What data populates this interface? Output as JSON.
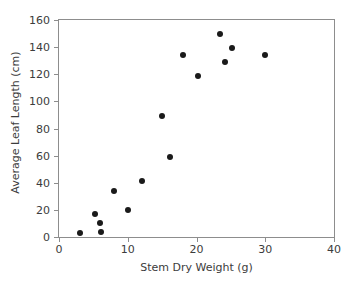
{
  "chart_data": {
    "type": "scatter",
    "title": "",
    "xlabel": "Stem Dry Weight (g)",
    "ylabel": "Average Leaf Length (cm)",
    "xlim": [
      0,
      40
    ],
    "ylim": [
      0,
      160
    ],
    "xticks": [
      0,
      10,
      20,
      30,
      40
    ],
    "yticks": [
      0,
      20,
      40,
      60,
      80,
      100,
      120,
      140,
      160
    ],
    "xtick_labels": [
      "0",
      "10",
      "20",
      "30",
      "40"
    ],
    "ytick_labels": [
      "0",
      "20",
      "40",
      "60",
      "80",
      "100",
      "120",
      "140",
      "160"
    ],
    "grid": false,
    "legend": null,
    "marker": "filled-circle",
    "marker_color": "#1a1a1a",
    "axis_color": "#8d8d8d",
    "text_color": "#3c3c3c",
    "points": [
      {
        "x": 3.0,
        "y": 3
      },
      {
        "x": 5.2,
        "y": 17
      },
      {
        "x": 6.0,
        "y": 10
      },
      {
        "x": 6.1,
        "y": 4
      },
      {
        "x": 8.0,
        "y": 34
      },
      {
        "x": 10.0,
        "y": 20
      },
      {
        "x": 12.0,
        "y": 41
      },
      {
        "x": 15.0,
        "y": 89
      },
      {
        "x": 16.2,
        "y": 59
      },
      {
        "x": 18.0,
        "y": 134
      },
      {
        "x": 20.2,
        "y": 119
      },
      {
        "x": 23.4,
        "y": 150
      },
      {
        "x": 24.2,
        "y": 129
      },
      {
        "x": 25.2,
        "y": 139
      },
      {
        "x": 30.0,
        "y": 134
      }
    ]
  }
}
